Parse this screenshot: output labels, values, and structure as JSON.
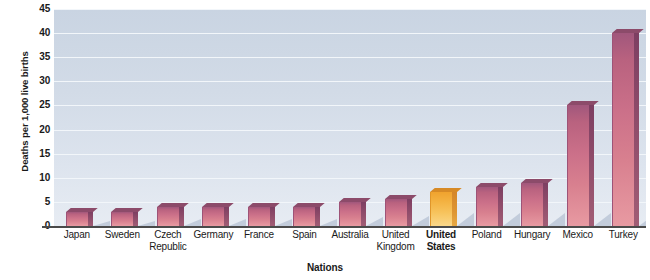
{
  "chart_data": {
    "type": "bar",
    "title": "",
    "xlabel": "Nations",
    "ylabel": "Deaths per 1,000 live births",
    "ylim": [
      0,
      45
    ],
    "ytick_step": 5,
    "yticks": [
      "45",
      "40",
      "35",
      "30",
      "25",
      "20",
      "15",
      "10",
      "5",
      "0"
    ],
    "grid": true,
    "legend": "none",
    "categories": [
      "Japan",
      "Sweden",
      "Czech Republic",
      "Germany",
      "France",
      "Spain",
      "Australia",
      "United Kingdom",
      "United States",
      "Poland",
      "Hungary",
      "Mexico",
      "Turkey"
    ],
    "values": [
      3,
      3,
      4,
      4,
      4,
      4,
      5,
      5.5,
      7,
      8,
      9,
      25,
      40
    ],
    "highlight_category": "United States",
    "colors": {
      "bar": "#cb7089",
      "bar_dark_edge": "#8c4b6a",
      "highlight_bar": "#f7c35c",
      "highlight_dark_edge": "#d78a26",
      "plot_background": "#d2dbe7",
      "gridline": "#f2f6fa",
      "axis": "#4a4a4a",
      "text": "#1a1a1a"
    }
  },
  "axis": {
    "y_title": "Deaths per 1,000 live births",
    "x_title": "Nations"
  },
  "x_labels": [
    {
      "lines": [
        "Japan"
      ],
      "highlight": false
    },
    {
      "lines": [
        "Sweden"
      ],
      "highlight": false
    },
    {
      "lines": [
        "Czech",
        "Republic"
      ],
      "highlight": false
    },
    {
      "lines": [
        "Germany"
      ],
      "highlight": false
    },
    {
      "lines": [
        "France"
      ],
      "highlight": false
    },
    {
      "lines": [
        "Spain"
      ],
      "highlight": false
    },
    {
      "lines": [
        "Australia"
      ],
      "highlight": false
    },
    {
      "lines": [
        "United",
        "Kingdom"
      ],
      "highlight": false
    },
    {
      "lines": [
        "United",
        "States"
      ],
      "highlight": true
    },
    {
      "lines": [
        "Poland"
      ],
      "highlight": false
    },
    {
      "lines": [
        "Hungary"
      ],
      "highlight": false
    },
    {
      "lines": [
        "Mexico"
      ],
      "highlight": false
    },
    {
      "lines": [
        "Turkey"
      ],
      "highlight": false
    }
  ]
}
